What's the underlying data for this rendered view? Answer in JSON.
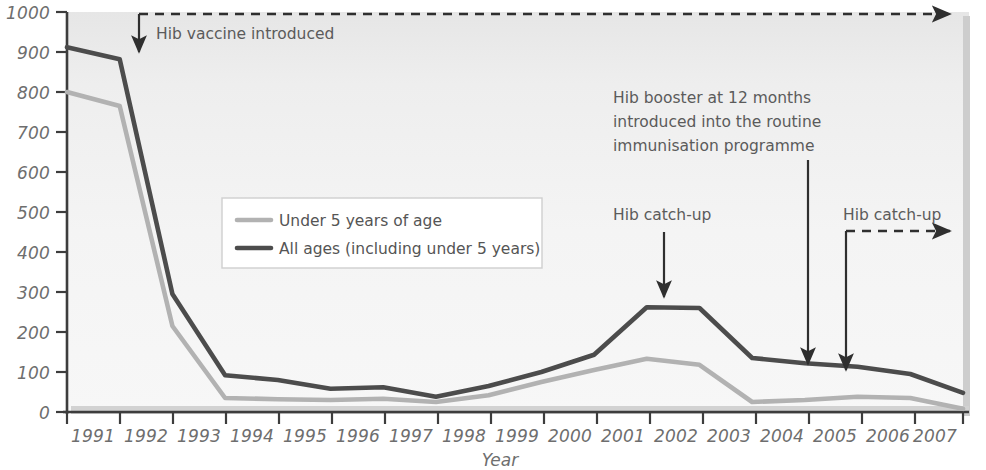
{
  "chart_data": {
    "type": "line",
    "title": "",
    "xlabel": "Year",
    "ylabel": "",
    "grid": false,
    "legend_position": "inside-left",
    "x": [
      1991,
      1992,
      1993,
      1994,
      1995,
      1996,
      1997,
      1998,
      1999,
      2000,
      2001,
      2002,
      2003,
      2004,
      2005,
      2006,
      2007,
      2008
    ],
    "xlim": [
      1991,
      2008
    ],
    "ylim": [
      0,
      1000
    ],
    "ytick_labels": [
      "0",
      "100",
      "200",
      "300",
      "400",
      "500",
      "600",
      "700",
      "800",
      "900",
      "1000"
    ],
    "yticks": [
      0,
      100,
      200,
      300,
      400,
      500,
      600,
      700,
      800,
      900,
      1000
    ],
    "xtick_labels": [
      "1991",
      "1992",
      "1993",
      "1994",
      "1995",
      "1996",
      "1997",
      "1998",
      "1999",
      "2000",
      "2001",
      "2002",
      "2003",
      "2004",
      "2005",
      "2006",
      "2007",
      "2008"
    ],
    "series": [
      {
        "name": "Under 5 years of age",
        "color": "#b2b2b2",
        "values": [
          800,
          765,
          215,
          35,
          32,
          30,
          33,
          25,
          42,
          75,
          105,
          133,
          118,
          25,
          30,
          38,
          35,
          8
        ]
      },
      {
        "name": "All ages (including under 5 years)",
        "color": "#4c4c4c",
        "values": [
          912,
          882,
          295,
          92,
          80,
          58,
          62,
          38,
          65,
          100,
          143,
          262,
          260,
          135,
          122,
          113,
          95,
          48
        ]
      }
    ],
    "annotations": [
      {
        "id": "hib-vaccine-introduced",
        "label": "Hib vaccine introduced",
        "year": 1992,
        "arrow": "down-with-trailing-dashed-right",
        "dashed": true
      },
      {
        "id": "hib-catch-up-2003",
        "label": "Hib catch-up",
        "year": 2003,
        "arrow": "down",
        "dashed": false
      },
      {
        "id": "hib-booster-12-months",
        "label_lines": [
          "Hib booster at 12 months",
          "introduced into the routine",
          "immunisation programme"
        ],
        "year": 2006,
        "arrow": "down",
        "dashed": false
      },
      {
        "id": "hib-catch-up-2007",
        "label": "Hib catch-up",
        "year": 2007,
        "arrow": "down-with-trailing-dashed-right",
        "dashed": true
      }
    ]
  },
  "legend": {
    "items": [
      {
        "label": "Under 5 years of age",
        "color": "#b2b2b2"
      },
      {
        "label": "All ages (including under 5 years)",
        "color": "#4c4c4c"
      }
    ]
  },
  "annotation_text": {
    "vaccine_introduced": "Hib vaccine introduced",
    "catch_up_2003": "Hib catch-up",
    "booster_line1": "Hib booster at 12 months",
    "booster_line2": "introduced into the routine",
    "booster_line3": "immunisation programme",
    "catch_up_2007": "Hib catch-up"
  },
  "axes": {
    "x_title": "Year",
    "y_ticks": [
      "1000",
      "900",
      "800",
      "700",
      "600",
      "500",
      "400",
      "300",
      "200",
      "100",
      "0"
    ],
    "x_ticks": [
      "1991",
      "1992",
      "1993",
      "1994",
      "1995",
      "1996",
      "1997",
      "1998",
      "1999",
      "2000",
      "2001",
      "2002",
      "2003",
      "2004",
      "2005",
      "2006",
      "2007",
      "2008"
    ]
  },
  "colors": {
    "under5": "#b2b2b2",
    "all_ages": "#4c4c4c",
    "axis": "#3d3d3d",
    "text": "#6e6e6e",
    "plot_bg": "#f2f2f2"
  }
}
